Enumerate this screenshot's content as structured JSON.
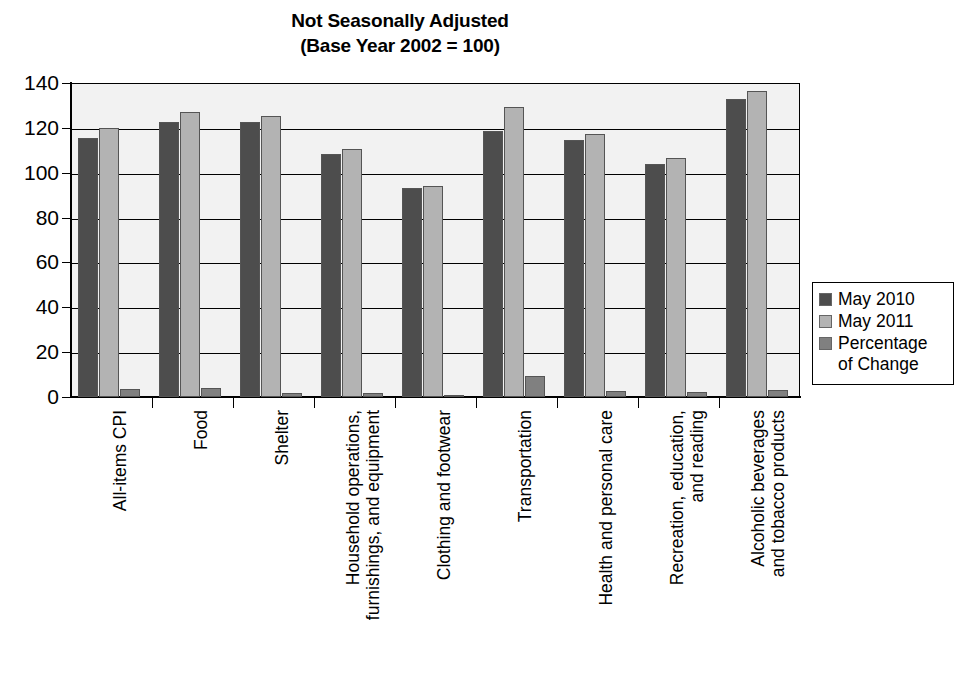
{
  "chart_data": {
    "type": "bar",
    "title": "Not Seasonally Adjusted",
    "subtitle": "(Base Year 2002 = 100)",
    "xlabel": "",
    "ylabel": "",
    "ylim": [
      0,
      140
    ],
    "ytick_step": 20,
    "yticks": [
      "140",
      "120",
      "100",
      "80",
      "60",
      "40",
      "20",
      "0"
    ],
    "grid": true,
    "legend_position": "right",
    "categories": [
      "All-items CPI",
      "Food",
      "Shelter",
      "Household operations,\nfurnishings, and equipment",
      "Clothing and footwear",
      "Transportation",
      "Health and personal care",
      "Recreation, education,\nand reading",
      "Alcoholic beverages\nand tobacco products"
    ],
    "series": [
      {
        "name": "May 2010",
        "color": "#4d4d4d",
        "values": [
          115.3,
          122.5,
          122.8,
          108.5,
          93.0,
          118.5,
          114.6,
          104.0,
          133.0
        ]
      },
      {
        "name": "May 2011",
        "color": "#b3b3b3",
        "values": [
          119.8,
          127.2,
          125.2,
          110.5,
          94.0,
          129.2,
          117.4,
          106.4,
          136.6
        ]
      },
      {
        "name": "Percentage\nof Change",
        "color": "#808080",
        "values": [
          3.7,
          3.8,
          1.6,
          1.7,
          1.0,
          9.5,
          2.5,
          2.3,
          3.0
        ]
      }
    ]
  },
  "colors": {
    "plot_background": "#f2f2f2",
    "axis": "#000000",
    "grid": "#000000",
    "series_may_2010": "#4d4d4d",
    "series_may_2011": "#b3b3b3",
    "series_pct_change": "#808080"
  }
}
